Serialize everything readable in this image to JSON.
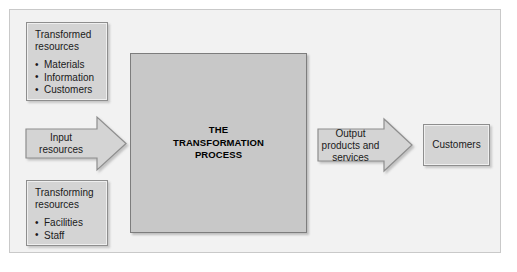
{
  "diagram": {
    "title_text": "THE\nTRANSFORMATION\nPROCESS",
    "transformed": {
      "title": "Transformed\nresources",
      "items": [
        "Materials",
        "Information",
        "Customers"
      ]
    },
    "transforming": {
      "title": "Transforming\nresources",
      "items": [
        "Facilities",
        "Staff"
      ]
    },
    "input_arrow_label": "Input\nresources",
    "output_arrow_label": "Output\nproducts and\nservices",
    "customers_label": "Customers"
  },
  "colors": {
    "panel_background": "#f2f2f2",
    "panel_border": "#c9c9c9",
    "box_fill": "#d4d4d4",
    "box_border": "#8e8e8e",
    "process_fill": "#c8c8c8",
    "process_border": "#7d7d7d",
    "arrow_fill": "#d4d4d4",
    "arrow_border": "#8e8e8e",
    "text": "#1a1a1a"
  }
}
